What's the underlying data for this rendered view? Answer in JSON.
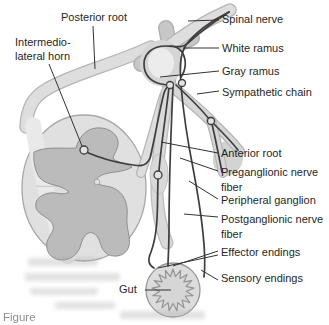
{
  "canvas": {
    "width": 329,
    "height": 325,
    "background": "#ffffff"
  },
  "diagram": {
    "type": "anatomical-line-diagram",
    "labels": {
      "posterior_root": "Posterior root",
      "intermediolateral_horn_line1": "Intermedio-",
      "intermediolateral_horn_line2": "lateral horn",
      "spinal_nerve": "Spinal nerve",
      "white_ramus": "White ramus",
      "gray_ramus": "Gray ramus",
      "sympathetic_chain": "Sympathetic chain",
      "anterior_root": "Anterior root",
      "preganglionic_nerve_fiber": "Preganglionic nerve fiber",
      "peripheral_ganglion": "Peripheral ganglion",
      "postganglionic_nerve_fiber": "Postganglionic nerve fiber",
      "effector_endings": "Effector endings",
      "sensory_endings": "Sensory endings",
      "gut": "Gut"
    },
    "caption_partial": "Figure",
    "colors": {
      "nerve_line_dark": "#3e3e3e",
      "leader_line": "#333333",
      "band_fill": "#dedede",
      "band_edge": "#b5b5b5",
      "cord_fill": "#e0e0e0",
      "gray_matter_fill": "#bbbbbb",
      "gray_matter_outline": "#8f8f8f",
      "gut_fill": "#dcdcdc",
      "text": "#1f1f1f"
    }
  }
}
